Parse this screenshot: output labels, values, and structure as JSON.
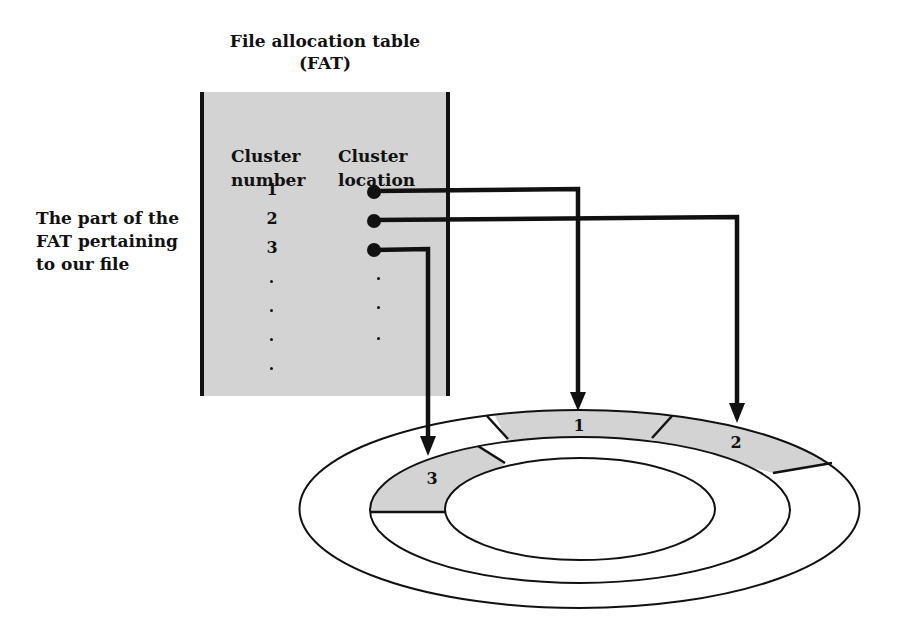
{
  "title": {
    "line1": "File allocation table",
    "line2": "(FAT)"
  },
  "side_label": {
    "lines": [
      "The part of the",
      "FAT pertaining",
      "to our file"
    ]
  },
  "fat_table": {
    "columns": [
      {
        "line1": "Cluster",
        "line2": "number"
      },
      {
        "line1": "Cluster",
        "line2": "location"
      }
    ],
    "rows": [
      {
        "cluster_number": "1",
        "location_pointer": "points to disk segment 1"
      },
      {
        "cluster_number": "2",
        "location_pointer": "points to disk segment 2"
      },
      {
        "cluster_number": "3",
        "location_pointer": "points to disk segment 3"
      }
    ],
    "continuation": "."
  },
  "disk": {
    "segments": [
      {
        "label": "1",
        "ring": "outer"
      },
      {
        "label": "2",
        "ring": "outer"
      },
      {
        "label": "3",
        "ring": "inner"
      }
    ]
  },
  "colors": {
    "shade": "#d3d3d3",
    "ink": "#111111",
    "background": "#ffffff"
  }
}
